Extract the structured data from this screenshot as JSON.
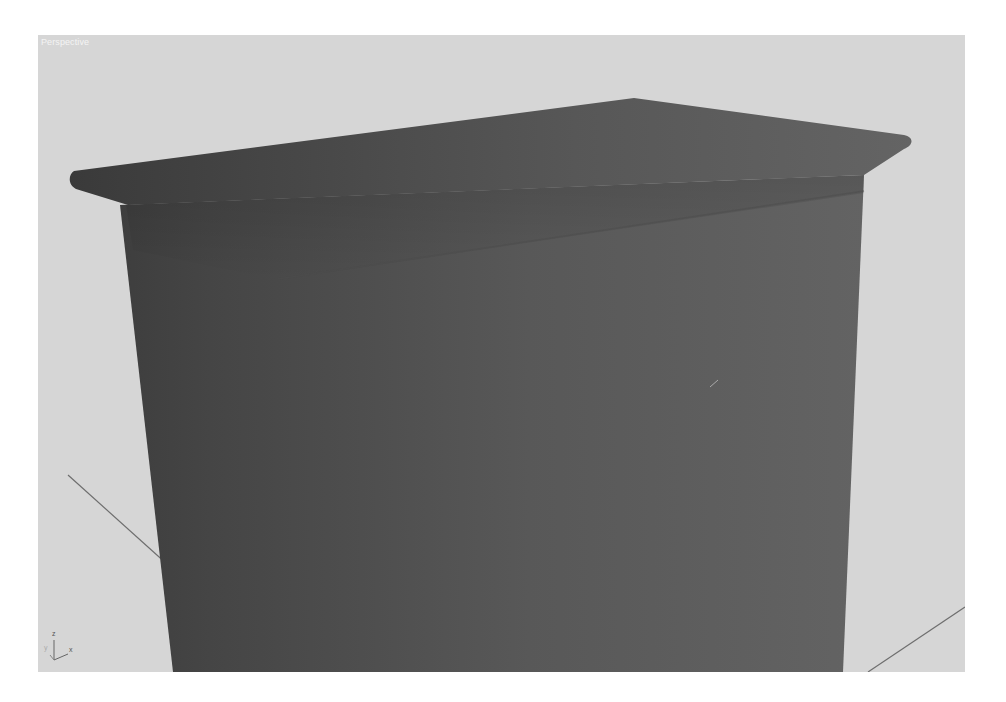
{
  "viewport": {
    "label": "Perspective",
    "background_color": "#d6d6d6",
    "object_color": "#5a5a5a",
    "grid_line_color": "#6e6e6e"
  },
  "axis_gizmo": {
    "z_label": "z",
    "x_label": "x",
    "y_label": "y"
  }
}
